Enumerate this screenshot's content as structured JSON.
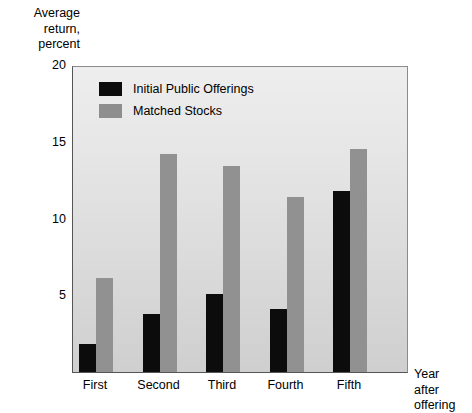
{
  "chart_data": {
    "type": "bar",
    "title": "",
    "categories": [
      "First",
      "Second",
      "Third",
      "Fourth",
      "Fifth"
    ],
    "series": [
      {
        "name": "Initial Public Offerings",
        "color": "#0c0c0c",
        "values": [
          1.8,
          3.8,
          5.1,
          4.1,
          11.8
        ]
      },
      {
        "name": "Matched Stocks",
        "color": "#919191",
        "values": [
          6.1,
          14.2,
          13.4,
          11.4,
          14.5
        ]
      }
    ],
    "ylabel": "Average\nreturn,\npercent",
    "xlabel": "Year\nafter\noffering",
    "ylim": [
      0,
      20
    ],
    "yticks": [
      5,
      10,
      15,
      20
    ],
    "ytick_labels": [
      "5",
      "10",
      "15",
      "20"
    ],
    "grid": false,
    "legend_position": "top-left-inside"
  },
  "axes": {
    "y_title": "Average\nreturn,\npercent",
    "x_title": "Year\nafter\noffering"
  },
  "legend": {
    "items": [
      {
        "label": "Initial Public Offerings",
        "swatch": "ipo"
      },
      {
        "label": "Matched Stocks",
        "swatch": "matched"
      }
    ]
  }
}
